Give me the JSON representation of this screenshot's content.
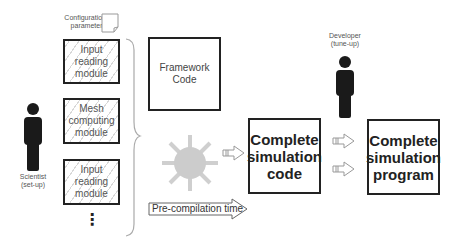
{
  "diagram": {
    "config": {
      "label_line1": "Configuration",
      "label_line2": "parameters"
    },
    "modules": [
      {
        "line1": "Input reading",
        "line2": "module",
        "line3": ""
      },
      {
        "line1": "Mesh",
        "line2": "computing",
        "line3": "module"
      },
      {
        "line1": "Input reading",
        "line2": "module",
        "line3": ""
      }
    ],
    "ellipsis": "⋮",
    "scientist": {
      "line1": "Scientist",
      "line2": "(set-up)"
    },
    "developer": {
      "line1": "Developer",
      "line2": "(tune-up)"
    },
    "framework": {
      "line1": "Framework",
      "line2": "Code"
    },
    "complete_code": {
      "line1": "Complete",
      "line2": "simulation",
      "line3": "code"
    },
    "complete_program": {
      "line1": "Complete",
      "line2": "simulation",
      "line3": "program"
    },
    "precompilation": {
      "label": "Pre-compilation time"
    },
    "colors": {
      "stroke": "#222222",
      "gear": "#cccccc",
      "person": "#1a1a1a",
      "arrow": "#999999"
    }
  }
}
